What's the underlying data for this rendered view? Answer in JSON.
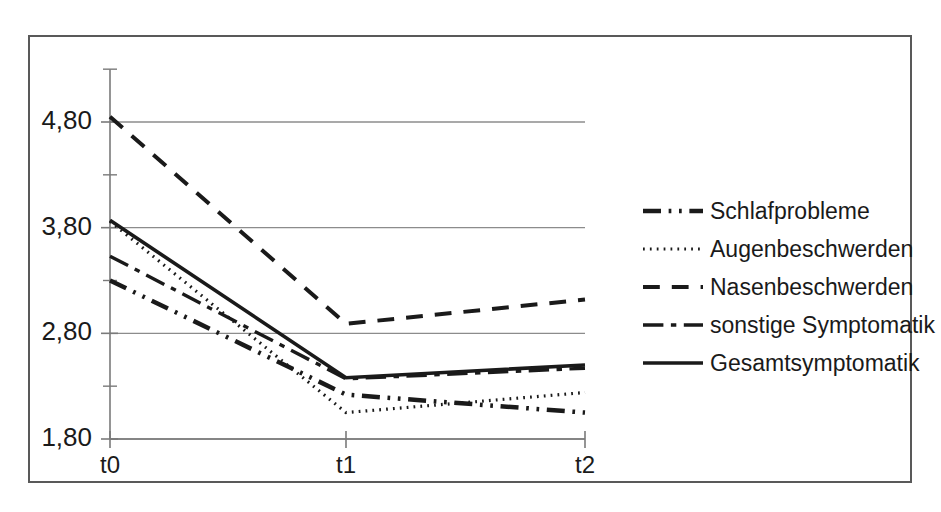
{
  "chart_data": {
    "type": "line",
    "title": "",
    "xlabel": "",
    "ylabel": "",
    "categories": [
      "t0",
      "t1",
      "t2"
    ],
    "x_tick_labels": [
      "t0",
      "t1",
      "t2"
    ],
    "y_tick_labels": [
      "1,80",
      "2,80",
      "3,80",
      "4,80"
    ],
    "y_tick_values": [
      1.8,
      2.8,
      3.8,
      4.8
    ],
    "y_minor_tick_values": [
      2.3,
      3.3,
      4.3,
      5.3
    ],
    "ylim": [
      1.8,
      5.3
    ],
    "grid": "horizontal",
    "legend_position": "right",
    "series": [
      {
        "name": "Schlafprobleme",
        "style": "dash-dot-dot",
        "width": 4.5,
        "color": "#1a1a1a",
        "values": [
          3.3,
          2.22,
          2.05
        ]
      },
      {
        "name": "Augenbeschwerden",
        "style": "dotted",
        "width": 3.2,
        "color": "#1a1a1a",
        "values": [
          3.86,
          2.05,
          2.24
        ]
      },
      {
        "name": "Nasenbeschwerden",
        "style": "dashed",
        "width": 4.0,
        "color": "#1a1a1a",
        "values": [
          4.85,
          2.89,
          3.12
        ]
      },
      {
        "name": "sonstige Symptomatik",
        "style": "long-dash-short-dash",
        "width": 3.4,
        "color": "#1a1a1a",
        "values": [
          3.53,
          2.37,
          2.47
        ]
      },
      {
        "name": "Gesamtsymptomatik",
        "style": "solid",
        "width": 3.6,
        "color": "#1a1a1a",
        "values": [
          3.87,
          2.38,
          2.5
        ]
      }
    ]
  },
  "legend": {
    "items": [
      {
        "label": "Schlafprobleme"
      },
      {
        "label": "Augenbeschwerden"
      },
      {
        "label": "Nasenbeschwerden"
      },
      {
        "label": "sonstige Symptomatik"
      },
      {
        "label": "Gesamtsymptomatik"
      }
    ]
  },
  "axes": {
    "y_labels": [
      "4,80",
      "3,80",
      "2,80",
      "1,80"
    ],
    "x_labels": [
      "t0",
      "t1",
      "t2"
    ]
  },
  "colors": {
    "line": "#1a1a1a",
    "grid": "#8c8c8c",
    "axis": "#7a7a7a",
    "frame": "#595959",
    "background": "#ffffff"
  }
}
